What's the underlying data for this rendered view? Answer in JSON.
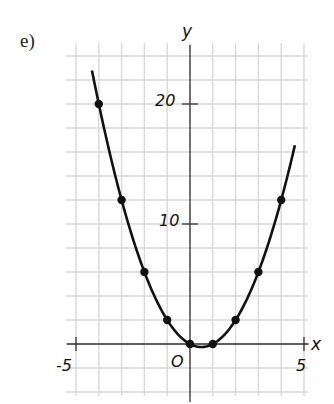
{
  "part_label": "e)",
  "chart_data": {
    "type": "line",
    "title": "",
    "xlabel": "x",
    "ylabel": "y",
    "origin_label": "O",
    "xlim": [
      -5,
      5
    ],
    "ylim": [
      -4,
      24
    ],
    "grid": true,
    "x_tick_labels": [
      "-5",
      "5"
    ],
    "y_tick_labels": [
      "10",
      "20"
    ],
    "function": "y = x^2 - x",
    "points": {
      "x": [
        -4,
        -3,
        -2,
        -1,
        0,
        1,
        2,
        3,
        4
      ],
      "y": [
        20,
        12,
        6,
        2,
        0,
        0,
        2,
        6,
        12
      ]
    },
    "curve_range": [
      -4.3,
      4.6
    ],
    "colors": {
      "grid": "#d9d9d9",
      "curve": "#111111",
      "axes": "#333333"
    }
  }
}
